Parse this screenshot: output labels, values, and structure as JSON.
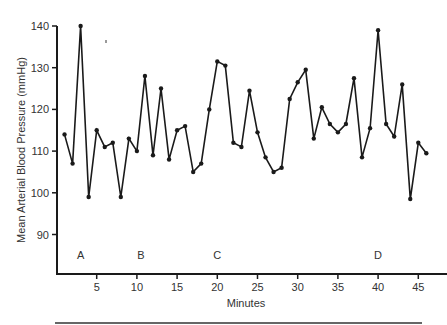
{
  "chart_data": {
    "type": "line",
    "title": "",
    "xlabel": "Minutes",
    "ylabel": "Mean Arterial Blood Pressure (mmHg)",
    "xlim": [
      0,
      48
    ],
    "ylim": [
      80,
      140
    ],
    "x_ticks": [
      5,
      10,
      15,
      20,
      25,
      30,
      35,
      40,
      45
    ],
    "y_ticks": [
      90,
      100,
      110,
      120,
      130,
      140
    ],
    "grid": false,
    "legend": null,
    "markers": true,
    "line_color": "#1a1a1a",
    "annotations": [
      {
        "text": "A",
        "x": 3,
        "y": 84
      },
      {
        "text": "B",
        "x": 10.5,
        "y": 84
      },
      {
        "text": "C",
        "x": 20,
        "y": 84
      },
      {
        "text": "D",
        "x": 40,
        "y": 84
      }
    ],
    "series": [
      {
        "name": "Mean Arterial Blood Pressure",
        "x": [
          1,
          2,
          3,
          4,
          5,
          6,
          7,
          8,
          9,
          10,
          11,
          12,
          13,
          14,
          15,
          16,
          17,
          18,
          19,
          20,
          21,
          22,
          23,
          24,
          25,
          26,
          27,
          28,
          29,
          30,
          31,
          32,
          33,
          34,
          35,
          36,
          37,
          38,
          39,
          40,
          41,
          42,
          43,
          44,
          45,
          46
        ],
        "values": [
          114,
          107,
          140,
          99,
          115,
          111,
          112,
          99,
          113,
          110,
          128,
          109,
          125,
          108,
          115,
          116,
          105,
          107,
          120,
          131.5,
          130.5,
          112,
          111,
          124.5,
          114.5,
          108.5,
          105,
          106,
          122.5,
          126.5,
          129.5,
          113,
          120.5,
          116.5,
          114.5,
          116.5,
          127.5,
          108.5,
          115.5,
          139,
          116.5,
          113.5,
          126,
          98.5,
          112,
          109.5
        ]
      }
    ]
  }
}
